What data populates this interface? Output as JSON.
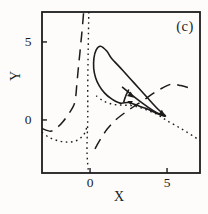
{
  "figure": {
    "panel_label": "(c)",
    "background_color": "#fdfcfa",
    "ink_color": "#1c1c1c"
  },
  "chart_data": {
    "type": "line",
    "title": "",
    "xlabel": "X",
    "ylabel": "Y",
    "xlim": [
      -3.12,
      7.14
    ],
    "ylim": [
      -3.4,
      6.92
    ],
    "grid": false,
    "legend": "none",
    "plot_rect_px": {
      "left": 42,
      "top": 12,
      "width": 158,
      "height": 161
    },
    "xticks": [
      {
        "value": 0,
        "label": "0"
      },
      {
        "value": 5,
        "label": "5"
      }
    ],
    "yticks": [
      {
        "value": 0,
        "label": "0"
      },
      {
        "value": 5,
        "label": "5"
      }
    ],
    "series": [
      {
        "name": "limit-cycle",
        "style": "solid",
        "closed": true,
        "smooth": true,
        "points": [
          [
            0.68,
            4.72
          ],
          [
            1.08,
            4.42
          ],
          [
            1.38,
            3.98
          ],
          [
            2.1,
            3.2
          ],
          [
            2.9,
            2.33
          ],
          [
            3.7,
            1.45
          ],
          [
            4.4,
            0.7
          ],
          [
            4.9,
            0.25
          ],
          [
            4.35,
            0.42
          ],
          [
            3.65,
            0.73
          ],
          [
            3.0,
            0.95
          ],
          [
            2.5,
            1.12
          ],
          [
            1.95,
            1.08
          ],
          [
            1.4,
            1.35
          ],
          [
            0.95,
            1.72
          ],
          [
            0.6,
            2.18
          ],
          [
            0.36,
            2.7
          ],
          [
            0.24,
            3.3
          ],
          [
            0.25,
            3.95
          ],
          [
            0.4,
            4.5
          ]
        ]
      },
      {
        "name": "inner-lens-upper",
        "style": "solid",
        "closed": false,
        "smooth": true,
        "points": [
          [
            2.08,
            2.12
          ],
          [
            2.7,
            1.62
          ],
          [
            3.4,
            1.08
          ],
          [
            4.1,
            0.6
          ],
          [
            4.72,
            0.28
          ]
        ]
      },
      {
        "name": "tangle-stroke",
        "style": "solid",
        "closed": false,
        "smooth": true,
        "points": [
          [
            2.52,
            1.95
          ],
          [
            2.3,
            1.5
          ],
          [
            2.18,
            1.12
          ]
        ]
      },
      {
        "name": "dashed-nullcline-left",
        "style": "dashed",
        "closed": false,
        "smooth": true,
        "points": [
          [
            -3.12,
            -0.55
          ],
          [
            -2.55,
            -0.72
          ],
          [
            -2.1,
            -0.45
          ],
          [
            -1.75,
            -0.1
          ],
          [
            -1.35,
            0.45
          ],
          [
            -1.05,
            0.95
          ],
          [
            -0.92,
            1.6
          ],
          [
            -0.85,
            2.4
          ],
          [
            -0.76,
            3.3
          ],
          [
            -0.66,
            4.3
          ],
          [
            -0.55,
            5.4
          ],
          [
            -0.45,
            6.5
          ],
          [
            -0.42,
            6.92
          ]
        ]
      },
      {
        "name": "dashed-nullcline-right",
        "style": "dashed",
        "closed": false,
        "smooth": true,
        "points": [
          [
            0.32,
            -1.85
          ],
          [
            0.7,
            -1.2
          ],
          [
            1.1,
            -0.6
          ],
          [
            1.55,
            -0.1
          ],
          [
            2.1,
            0.35
          ],
          [
            2.75,
            0.8
          ],
          [
            3.45,
            1.25
          ],
          [
            4.1,
            1.7
          ],
          [
            4.7,
            2.05
          ],
          [
            5.3,
            2.3
          ],
          [
            5.9,
            2.2
          ],
          [
            6.5,
            2.05
          ]
        ]
      },
      {
        "name": "dotted-nullcline-vertical",
        "style": "dotted",
        "closed": false,
        "smooth": true,
        "points": [
          [
            -0.08,
            6.92
          ],
          [
            -0.12,
            4.5
          ],
          [
            -0.15,
            2.0
          ],
          [
            -0.15,
            0.0
          ],
          [
            -0.2,
            -2.0
          ],
          [
            -0.1,
            -3.4
          ]
        ]
      },
      {
        "name": "dotted-nullcline-hook",
        "style": "dotted",
        "closed": false,
        "smooth": true,
        "points": [
          [
            -3.12,
            -0.8
          ],
          [
            -2.6,
            -1.15
          ],
          [
            -2.0,
            -1.35
          ],
          [
            -1.45,
            -1.42
          ],
          [
            -0.95,
            -1.35
          ],
          [
            -0.55,
            -1.1
          ],
          [
            -0.3,
            -0.75
          ],
          [
            -0.17,
            -0.3
          ]
        ]
      },
      {
        "name": "dotted-nullcline-diagonal",
        "style": "dotted",
        "closed": false,
        "smooth": true,
        "points": [
          [
            0.4,
            1.55
          ],
          [
            0.9,
            1.2
          ],
          [
            1.5,
            1.0
          ],
          [
            2.1,
            0.95
          ],
          [
            2.7,
            0.92
          ],
          [
            3.3,
            0.78
          ],
          [
            3.9,
            0.55
          ],
          [
            4.5,
            0.28
          ],
          [
            5.0,
            -0.05
          ],
          [
            5.6,
            -0.38
          ],
          [
            6.2,
            -0.72
          ],
          [
            6.8,
            -1.1
          ],
          [
            7.14,
            -1.32
          ]
        ]
      }
    ],
    "arrows": [
      {
        "name": "flow-arrow-mid",
        "x": 2.85,
        "y": 1.42,
        "angle_deg": 38,
        "size": 7
      },
      {
        "name": "flow-arrow-tip",
        "x": 4.88,
        "y": 0.26,
        "angle_deg": 38,
        "size": 7
      },
      {
        "name": "flow-arrow-return",
        "x": 2.42,
        "y": 1.22,
        "angle_deg": 205,
        "size": 5.5
      }
    ]
  }
}
